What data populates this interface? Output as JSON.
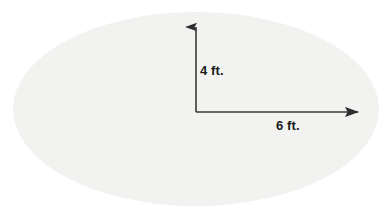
{
  "figure": {
    "shape": {
      "name": "ellipse",
      "fill_color": "#f2f2f0",
      "center_x": 196,
      "center_y": 109,
      "radius_x": 183,
      "radius_y": 97
    },
    "arrows": {
      "color": "#3a3a3a",
      "vertical": {
        "name": "semi-minor-axis-arrow",
        "from_x": 196,
        "from_y": 112,
        "to_x": 196,
        "to_y": 15
      },
      "horizontal": {
        "name": "semi-major-axis-arrow",
        "from_x": 196,
        "from_y": 112,
        "to_x": 371,
        "to_y": 112
      }
    },
    "labels": {
      "height": "4 ft.",
      "width": "6 ft."
    }
  }
}
